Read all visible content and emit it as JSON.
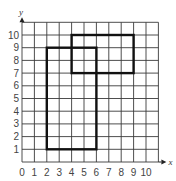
{
  "diagram": {
    "type": "coordinate-grid",
    "x_axis": {
      "label": "x",
      "ticks": [
        "0",
        "1",
        "2",
        "3",
        "4",
        "5",
        "6",
        "7",
        "8",
        "9",
        "10"
      ],
      "range": [
        0,
        11
      ]
    },
    "y_axis": {
      "label": "y",
      "ticks": [
        "1",
        "2",
        "3",
        "4",
        "5",
        "6",
        "7",
        "8",
        "9",
        "10"
      ],
      "range": [
        0,
        11
      ]
    },
    "shapes": [
      {
        "name": "tall-rectangle",
        "x1": 2,
        "y1": 1,
        "x2": 6,
        "y2": 9
      },
      {
        "name": "wide-rectangle",
        "x1": 4,
        "y1": 7,
        "x2": 9,
        "y2": 10
      }
    ],
    "colors": {
      "grid": "#3a3a3a",
      "shape": "#111111",
      "background": "#ffffff"
    }
  }
}
